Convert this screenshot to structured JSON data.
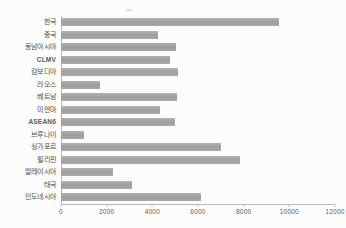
{
  "style": {
    "background": "#fcfcfa",
    "bar_color": "#9e9e9e",
    "axis_color": "#b8b8b6",
    "label_color": "#4d4d4d"
  },
  "chart_data": {
    "type": "bar",
    "orientation": "horizontal",
    "title": "",
    "xlabel": "",
    "ylabel": "",
    "categories": [
      "한국",
      "중국",
      "동남아시아",
      "CLMV",
      "캄보디아",
      "라오스",
      "베트남",
      "미얀마",
      "ASEAN6",
      "브루나이",
      "싱가포르",
      "필리핀",
      "말레이시아",
      "태국",
      "인도네시아"
    ],
    "values": [
      9600,
      4250,
      5050,
      4800,
      5150,
      1700,
      5100,
      4350,
      5000,
      1000,
      7050,
      7850,
      2300,
      3100,
      6150
    ],
    "latin_label_flags": [
      false,
      false,
      false,
      true,
      false,
      false,
      false,
      false,
      true,
      false,
      false,
      false,
      false,
      false,
      false
    ],
    "xlim": [
      0,
      12000
    ],
    "x_ticks": [
      0,
      2000,
      4000,
      6000,
      8000,
      10000,
      12000
    ],
    "x_tick_labels": [
      "0",
      "2000",
      "4000",
      "6000",
      "8000",
      "10000",
      "12000"
    ],
    "grid": false,
    "legend": false
  }
}
